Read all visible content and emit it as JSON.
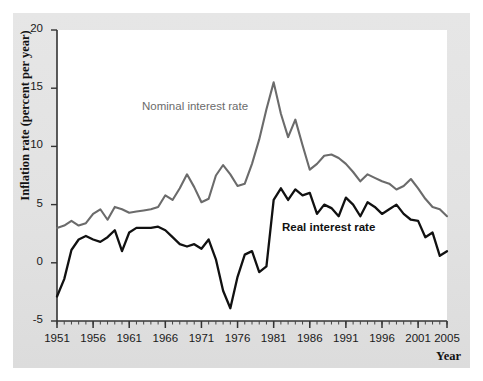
{
  "figure": {
    "background_color": "#ffffff",
    "panel_color": "#e3e3e3",
    "plot_color": "#ffffff"
  },
  "axes": {
    "y_title": "Inflation rate (percent per year)",
    "x_title": "Year",
    "y_ticks": [
      "20",
      "15",
      "10",
      "5",
      "0",
      "-5"
    ],
    "x_ticks": [
      "1951",
      "1956",
      "1961",
      "1966",
      "1971",
      "1976",
      "1981",
      "1986",
      "1991",
      "1996",
      "2001",
      "2005"
    ]
  },
  "labels": {
    "nominal": "Nominal interest rate",
    "real": "Real interest rate"
  },
  "chart_data": {
    "type": "line",
    "title": "",
    "xlabel": "Year",
    "ylabel": "Inflation rate (percent per year)",
    "xlim": [
      1951,
      2005
    ],
    "ylim": [
      -5,
      20
    ],
    "ytick_values": [
      20,
      15,
      10,
      5,
      0,
      -5
    ],
    "xtick_values": [
      1951,
      1956,
      1961,
      1966,
      1971,
      1976,
      1981,
      1986,
      1991,
      1996,
      2001,
      2005
    ],
    "grid": false,
    "legend": "inline-annotations",
    "colors": {
      "nominal": "#6b6b6b",
      "real": "#111111"
    },
    "x": [
      1951,
      1952,
      1953,
      1954,
      1955,
      1956,
      1957,
      1958,
      1959,
      1960,
      1961,
      1962,
      1963,
      1964,
      1965,
      1966,
      1967,
      1968,
      1969,
      1970,
      1971,
      1972,
      1973,
      1974,
      1975,
      1976,
      1977,
      1978,
      1979,
      1980,
      1981,
      1982,
      1983,
      1984,
      1985,
      1986,
      1987,
      1988,
      1989,
      1990,
      1991,
      1992,
      1993,
      1994,
      1995,
      1996,
      1997,
      1998,
      1999,
      2000,
      2001,
      2002,
      2003,
      2004,
      2005
    ],
    "series": [
      {
        "name": "Nominal interest rate",
        "color": "#6b6b6b",
        "values": [
          3.0,
          3.2,
          3.6,
          3.2,
          3.4,
          4.2,
          4.6,
          3.7,
          4.8,
          4.6,
          4.3,
          4.4,
          4.5,
          4.6,
          4.8,
          5.8,
          5.4,
          6.4,
          7.6,
          6.5,
          5.2,
          5.5,
          7.5,
          8.4,
          7.6,
          6.6,
          6.8,
          8.5,
          10.6,
          13.2,
          15.5,
          12.8,
          10.8,
          12.3,
          10.1,
          8.0,
          8.5,
          9.2,
          9.3,
          9.0,
          8.5,
          7.8,
          7.0,
          7.6,
          7.3,
          7.0,
          6.8,
          6.3,
          6.6,
          7.2,
          6.4,
          5.5,
          4.8,
          4.6,
          4.0
        ]
      },
      {
        "name": "Real interest rate",
        "color": "#111111",
        "values": [
          -2.9,
          -1.4,
          1.1,
          2.0,
          2.3,
          2.0,
          1.8,
          2.2,
          2.8,
          1.0,
          2.6,
          3.0,
          3.0,
          3.0,
          3.1,
          2.8,
          2.2,
          1.6,
          1.4,
          1.6,
          1.2,
          2.0,
          0.3,
          -2.4,
          -3.9,
          -1.2,
          0.7,
          1.0,
          -0.8,
          -0.3,
          5.4,
          6.4,
          5.4,
          6.3,
          5.8,
          6.0,
          4.2,
          5.0,
          4.7,
          4.0,
          5.6,
          5.0,
          4.0,
          5.2,
          4.8,
          4.2,
          4.6,
          5.0,
          4.2,
          3.7,
          3.6,
          2.2,
          2.6,
          0.6,
          1.0
        ]
      }
    ]
  }
}
